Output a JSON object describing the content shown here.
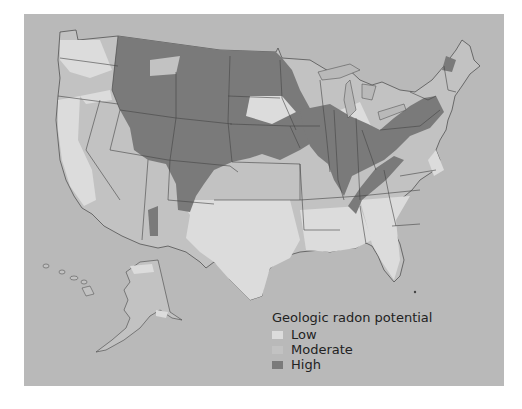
{
  "map": {
    "title": "Geologic radon potential",
    "subject": "Contiguous United States, Alaska and Hawaii",
    "colors": {
      "background": "#ffffff",
      "ocean": "#b9b9b9",
      "low": "#dcdcdc",
      "moderate": "#c2c2c2",
      "high": "#7a7a7a",
      "border": "#444444"
    }
  },
  "legend": {
    "title": "Geologic radon potential",
    "items": [
      {
        "label": "Low",
        "color": "#dcdcdc"
      },
      {
        "label": "Moderate",
        "color": "#c2c2c2"
      },
      {
        "label": "High",
        "color": "#7a7a7a"
      }
    ]
  }
}
